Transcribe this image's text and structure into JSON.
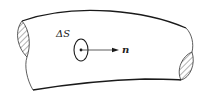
{
  "diagram": {
    "labels": {
      "surface_element": "ΔS",
      "normal_vector": "n"
    },
    "colors": {
      "stroke": "#1a1a1a",
      "hatch": "#555555",
      "background": "#ffffff"
    }
  }
}
